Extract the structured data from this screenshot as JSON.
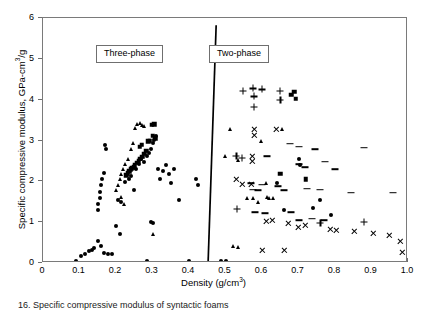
{
  "caption": "16. Specific compressive modulus of syntactic foams",
  "annotations": {
    "three_phase": "Three-phase",
    "two_phase": "Two-phase"
  },
  "chart_data": {
    "type": "scatter",
    "title": "",
    "xlabel": "Density (g/cm³)",
    "xlabel_parts": {
      "text": "Density (g/cm",
      "sup": "3",
      "tail": ")"
    },
    "ylabel": "Specific compressive modulus,  GPa-cm³/g",
    "ylabel_parts": {
      "text": "Specific compressive modulus,  GPa-cm",
      "sup": "3",
      "tail": "/g"
    },
    "xlim": [
      0,
      1.0
    ],
    "ylim": [
      0,
      6
    ],
    "xticks": [
      0,
      0.1,
      0.2,
      0.3,
      0.4,
      0.5,
      0.6,
      0.7,
      0.8,
      0.9,
      1.0
    ],
    "xtick_labels": [
      "0",
      "0.1",
      "0.2",
      "0.3",
      "0.4",
      "0.5",
      "0.6",
      "0.7",
      "0.8",
      "0.9",
      "1.0"
    ],
    "yticks": [
      0,
      1,
      2,
      3,
      4,
      5,
      6
    ],
    "ytick_labels": [
      "0",
      "1",
      "2",
      "3",
      "4",
      "5",
      "6"
    ],
    "grid": false,
    "legend": "none",
    "divider_line": {
      "x_top": 0.477,
      "y_top": 5.82,
      "x_bottom": 0.455,
      "y_bottom": 0.0
    },
    "series": [
      {
        "name": "circle",
        "marker": "circle",
        "points": [
          [
            0.09,
            0.06
          ],
          [
            0.105,
            0.17
          ],
          [
            0.115,
            0.21
          ],
          [
            0.125,
            0.3
          ],
          [
            0.133,
            0.33
          ],
          [
            0.14,
            0.36
          ],
          [
            0.15,
            0.55
          ],
          [
            0.158,
            0.42
          ],
          [
            0.168,
            0.25
          ],
          [
            0.178,
            0.23
          ],
          [
            0.19,
            0.22
          ],
          [
            0.2,
            0.9
          ],
          [
            0.21,
            0.7
          ],
          [
            0.285,
            0.06
          ],
          [
            0.295,
            1.0
          ],
          [
            0.3,
            0.98
          ],
          [
            0.4,
            0.05
          ],
          [
            0.487,
            0.06
          ],
          [
            0.5,
            0.06
          ],
          [
            0.155,
            1.6
          ],
          [
            0.157,
            1.75
          ],
          [
            0.16,
            1.9
          ],
          [
            0.163,
            2.05
          ],
          [
            0.168,
            2.2
          ],
          [
            0.15,
            1.45
          ],
          [
            0.152,
            1.3
          ],
          [
            0.17,
            2.9
          ],
          [
            0.172,
            2.78
          ],
          [
            0.205,
            1.55
          ],
          [
            0.215,
            1.5
          ],
          [
            0.225,
            1.98
          ],
          [
            0.235,
            2.05
          ],
          [
            0.24,
            2.12
          ],
          [
            0.25,
            1.8
          ],
          [
            0.255,
            2.3
          ],
          [
            0.262,
            2.42
          ],
          [
            0.268,
            2.55
          ],
          [
            0.272,
            2.6
          ],
          [
            0.278,
            2.48
          ],
          [
            0.285,
            2.62
          ],
          [
            0.29,
            2.7
          ],
          [
            0.295,
            2.8
          ],
          [
            0.3,
            2.95
          ],
          [
            0.305,
            3.02
          ],
          [
            0.31,
            3.1
          ],
          [
            0.315,
            2.3
          ],
          [
            0.32,
            2.05
          ],
          [
            0.33,
            2.25
          ],
          [
            0.338,
            2.4
          ],
          [
            0.345,
            2.18
          ],
          [
            0.352,
            1.95
          ],
          [
            0.36,
            2.3
          ],
          [
            0.372,
            1.55
          ],
          [
            0.42,
            2.05
          ],
          [
            0.425,
            1.92
          ],
          [
            0.64,
            1.95
          ],
          [
            0.66,
            1.3
          ],
          [
            0.7,
            2.55
          ],
          [
            0.705,
            2.4
          ],
          [
            0.74,
            1.35
          ],
          [
            0.76,
            1.55
          ],
          [
            0.79,
            1.18
          ]
        ]
      },
      {
        "name": "square",
        "marker": "square",
        "points": [
          [
            0.298,
            3.38
          ],
          [
            0.305,
            3.4
          ],
          [
            0.3,
            3.12
          ],
          [
            0.308,
            3.05
          ],
          [
            0.293,
            3.0
          ],
          [
            0.288,
            2.98
          ],
          [
            0.283,
            2.75
          ],
          [
            0.278,
            2.68
          ],
          [
            0.272,
            2.6
          ],
          [
            0.267,
            2.55
          ],
          [
            0.262,
            2.5
          ],
          [
            0.258,
            2.45
          ],
          [
            0.252,
            2.4
          ],
          [
            0.248,
            2.35
          ],
          [
            0.243,
            2.32
          ],
          [
            0.24,
            2.3
          ],
          [
            0.236,
            2.25
          ],
          [
            0.232,
            2.2
          ],
          [
            0.228,
            2.15
          ],
          [
            0.265,
            2.85
          ],
          [
            0.27,
            2.9
          ],
          [
            0.68,
            4.12
          ],
          [
            0.688,
            4.2
          ],
          [
            0.692,
            4.02
          ],
          [
            0.65,
            2.18
          ],
          [
            0.72,
            2.05
          ]
        ]
      },
      {
        "name": "triangle",
        "marker": "triangle",
        "points": [
          [
            0.258,
            3.4
          ],
          [
            0.265,
            3.42
          ],
          [
            0.272,
            3.38
          ],
          [
            0.278,
            3.35
          ],
          [
            0.252,
            3.3
          ],
          [
            0.246,
            2.95
          ],
          [
            0.24,
            2.8
          ],
          [
            0.232,
            2.55
          ],
          [
            0.226,
            2.42
          ],
          [
            0.22,
            2.3
          ],
          [
            0.215,
            2.18
          ],
          [
            0.21,
            2.05
          ],
          [
            0.205,
            1.92
          ],
          [
            0.2,
            1.8
          ],
          [
            0.213,
            1.62
          ],
          [
            0.222,
            1.45
          ],
          [
            0.3,
            0.72
          ],
          [
            0.498,
            2.62
          ],
          [
            0.512,
            3.28
          ],
          [
            0.535,
            2.52
          ],
          [
            0.56,
            1.6
          ],
          [
            0.575,
            1.58
          ],
          [
            0.588,
            1.5
          ],
          [
            0.612,
            1.95
          ],
          [
            0.614,
            1.62
          ],
          [
            0.62,
            1.58
          ],
          [
            0.63,
            1.58
          ],
          [
            0.598,
            3.0
          ],
          [
            0.655,
            3.28
          ],
          [
            0.52,
            0.42
          ],
          [
            0.535,
            0.38
          ]
        ]
      },
      {
        "name": "plus",
        "marker": "plus",
        "points": [
          [
            0.548,
            4.22
          ],
          [
            0.575,
            4.28
          ],
          [
            0.578,
            4.08
          ],
          [
            0.578,
            3.82
          ],
          [
            0.6,
            4.25
          ],
          [
            0.648,
            4.22
          ],
          [
            0.65,
            4.0
          ],
          [
            0.53,
            2.62
          ],
          [
            0.545,
            2.58
          ],
          [
            0.532,
            1.32
          ],
          [
            0.76,
            0.98
          ],
          [
            0.88,
            1.0
          ]
        ]
      },
      {
        "name": "cross",
        "marker": "cross",
        "points": [
          [
            0.578,
            3.28
          ],
          [
            0.578,
            3.12
          ],
          [
            0.575,
            2.62
          ],
          [
            0.575,
            2.48
          ],
          [
            0.64,
            3.28
          ],
          [
            0.57,
            1.92
          ],
          [
            0.545,
            1.92
          ],
          [
            0.53,
            2.05
          ],
          [
            0.612,
            1.02
          ],
          [
            0.628,
            1.05
          ],
          [
            0.672,
            0.98
          ],
          [
            0.7,
            0.88
          ],
          [
            0.72,
            0.92
          ],
          [
            0.788,
            0.82
          ],
          [
            0.805,
            0.8
          ],
          [
            0.852,
            0.78
          ],
          [
            0.905,
            0.72
          ],
          [
            0.95,
            0.68
          ],
          [
            0.98,
            0.52
          ],
          [
            0.985,
            0.25
          ],
          [
            0.6,
            0.32
          ],
          [
            0.662,
            0.3
          ]
        ]
      },
      {
        "name": "dash",
        "marker": "dash",
        "points": [
          [
            0.678,
            2.92
          ],
          [
            0.7,
            2.85
          ],
          [
            0.745,
            2.78
          ],
          [
            0.88,
            2.82
          ],
          [
            0.615,
            2.62
          ],
          [
            0.7,
            2.42
          ],
          [
            0.718,
            2.35
          ],
          [
            0.8,
            2.3
          ],
          [
            0.772,
            2.48
          ],
          [
            0.57,
            1.95
          ],
          [
            0.6,
            1.92
          ],
          [
            0.645,
            1.88
          ],
          [
            0.575,
            1.8
          ],
          [
            0.59,
            1.78
          ],
          [
            0.66,
            1.78
          ],
          [
            0.722,
            1.82
          ],
          [
            0.76,
            1.8
          ],
          [
            0.845,
            1.72
          ],
          [
            0.58,
            1.25
          ],
          [
            0.608,
            1.22
          ],
          [
            0.68,
            1.25
          ],
          [
            0.7,
            1.05
          ],
          [
            0.738,
            1.08
          ],
          [
            0.77,
            1.05
          ],
          [
            0.96,
            1.72
          ]
        ]
      }
    ]
  }
}
